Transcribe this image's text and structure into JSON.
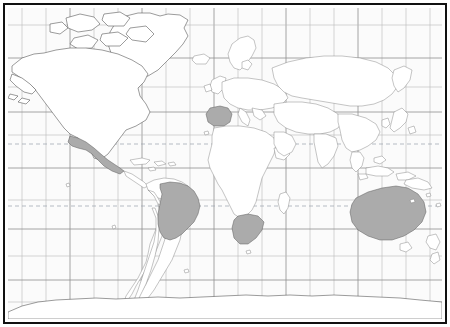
{
  "map": {
    "title": "World Map",
    "projection": "Mercator",
    "frame_color": "#111111",
    "ocean_color": "#fbfbfb",
    "land_color": "#ffffff",
    "land_border_color": "#7d7d7d",
    "highlight_color": "#ababab",
    "grid_color": "#b9b9b9",
    "grid_major_color": "#8f8f8f",
    "tropic_line_color": "#9aa0ac",
    "tropic_line_style": "dashed",
    "grid": {
      "enabled": true,
      "meridian_spacing_deg": 20,
      "parallel_spacing_deg": 20,
      "meridian_count": 17,
      "parallel_count": 9
    },
    "special_latitudes": [
      {
        "name": "Tropic of Cancer",
        "degrees": 23.5,
        "style": "dashed"
      },
      {
        "name": "Tropic of Capricorn",
        "degrees": -23.5,
        "style": "dashed"
      },
      {
        "name": "Equator",
        "degrees": 0,
        "style": "solid"
      }
    ],
    "highlighted_countries": [
      {
        "name": "Mexico",
        "continent": "North America",
        "fill": "#ababab"
      },
      {
        "name": "Brazil",
        "continent": "South America",
        "fill": "#ababab"
      },
      {
        "name": "Spain",
        "continent": "Europe",
        "fill": "#ababab"
      },
      {
        "name": "Portugal",
        "continent": "Europe",
        "fill": "#ababab"
      },
      {
        "name": "South Africa",
        "continent": "Africa",
        "fill": "#ababab"
      },
      {
        "name": "Australia",
        "continent": "Oceania",
        "fill": "#ababab"
      }
    ],
    "landmasses": [
      "North America",
      "South America",
      "Europe",
      "Africa",
      "Asia",
      "Oceania",
      "Antarctica",
      "Greenland"
    ],
    "caption": ""
  }
}
